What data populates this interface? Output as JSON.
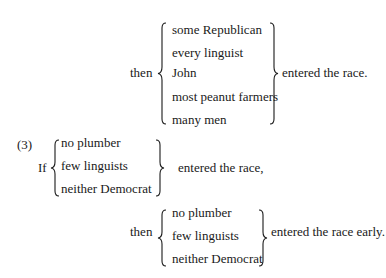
{
  "block1": {
    "prefix": "then",
    "items": [
      "some Republican",
      "every linguist",
      "John",
      "most peanut farmers",
      "many men"
    ],
    "suffix": "entered the race."
  },
  "example": {
    "number": "(3)",
    "antecedent": {
      "prefix": "If",
      "items": [
        "no plumber",
        "few linguists",
        "neither Democrat"
      ],
      "suffix": "entered the race,"
    },
    "consequent": {
      "prefix": "then",
      "items": [
        "no plumber",
        "few linguists",
        "neither Democrat"
      ],
      "suffix": "entered the race early."
    }
  }
}
